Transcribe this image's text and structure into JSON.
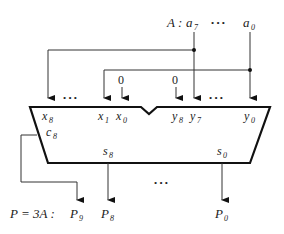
{
  "diagram": {
    "input_label": {
      "prefix": "A :",
      "msb": "a",
      "msb_sub": "7",
      "dots": "• • •",
      "lsb": "a",
      "lsb_sub": "0"
    },
    "adder": {
      "inputs_x": [
        {
          "name": "x",
          "sub": "8"
        },
        {
          "name": "x",
          "sub": "1"
        },
        {
          "name": "x",
          "sub": "0"
        }
      ],
      "inputs_y": [
        {
          "name": "y",
          "sub": "8"
        },
        {
          "name": "y",
          "sub": "7"
        },
        {
          "name": "y",
          "sub": "0"
        }
      ],
      "carry": {
        "name": "c",
        "sub": "8"
      },
      "sums": [
        {
          "name": "s",
          "sub": "8"
        },
        {
          "name": "s",
          "sub": "0"
        }
      ],
      "zero_inputs": [
        "0",
        "0"
      ],
      "dots": "• • •"
    },
    "output_label": {
      "prefix": "P = 3A :",
      "bits": [
        {
          "name": "P",
          "sub": "9"
        },
        {
          "name": "P",
          "sub": "8"
        },
        {
          "name": "P",
          "sub": "0"
        }
      ],
      "dots": "• • •"
    },
    "colors": {
      "line": "#111111",
      "thin": "#333333"
    }
  }
}
